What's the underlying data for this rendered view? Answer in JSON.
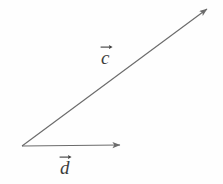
{
  "figure": {
    "background_color": "#fefefe",
    "stroke_color": "#6b6b6b",
    "label_color": "#3d3d3d"
  },
  "labels": {
    "c": "c",
    "d": "d"
  },
  "chart_data": {
    "type": "diagram",
    "subtype": "vector-diagram",
    "title": "",
    "xlabel": "",
    "ylabel": "",
    "grid": false,
    "legend": null,
    "coordinate_space": {
      "width": 223,
      "height": 184,
      "origin_note": "pixel coordinates, y increases downward"
    },
    "common_origin": [
      22,
      146
    ],
    "vectors": [
      {
        "name": "c",
        "label": "c",
        "label_style": "italic-with-overarrow",
        "tail": [
          22,
          146
        ],
        "head": [
          207,
          9
        ],
        "dx": 185,
        "dy": -137,
        "length_px": 230,
        "angle_deg": 36.5,
        "arrowhead": true,
        "color": "#6b6b6b",
        "label_position": [
          101,
          43
        ]
      },
      {
        "name": "d",
        "label": "d",
        "label_style": "italic-with-overarrow",
        "tail": [
          22,
          146
        ],
        "head": [
          120,
          145
        ],
        "dx": 98,
        "dy": -1,
        "length_px": 98,
        "angle_deg": 0,
        "arrowhead": true,
        "color": "#6b6b6b",
        "label_position": [
          60,
          153
        ]
      }
    ],
    "annotations": []
  }
}
